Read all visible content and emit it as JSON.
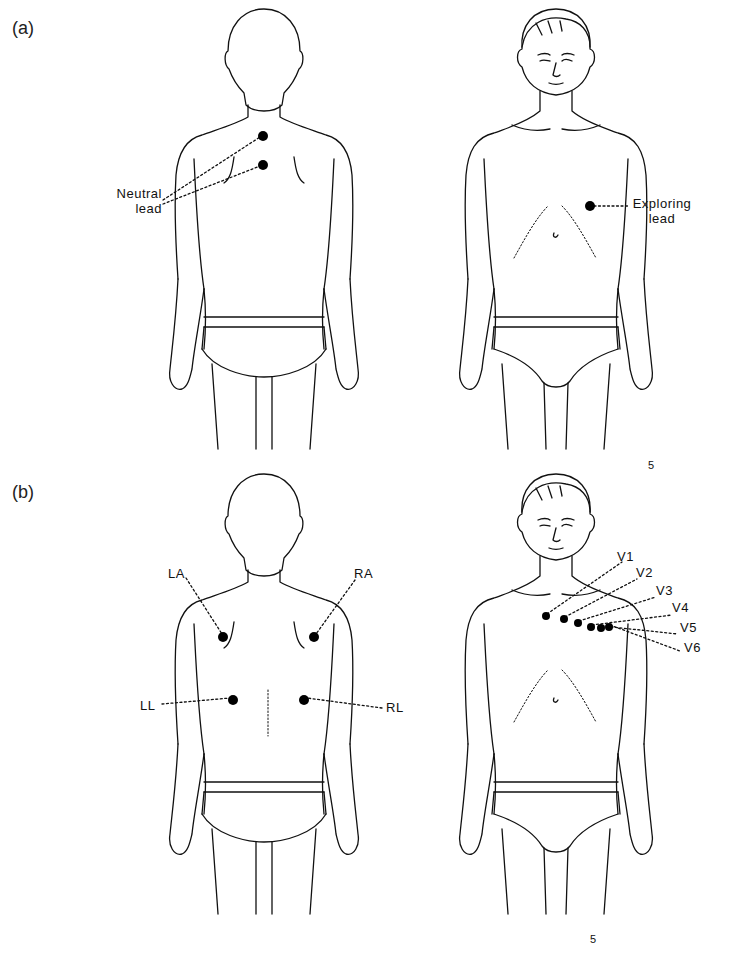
{
  "figure": {
    "panels": [
      {
        "id": "a",
        "label": "(a)",
        "figures": [
          {
            "view": "back",
            "electrodes": [
              {
                "x": 263,
                "y": 136
              },
              {
                "x": 263,
                "y": 165
              }
            ]
          },
          {
            "view": "front",
            "electrodes": [
              {
                "x": 590,
                "y": 206
              }
            ]
          }
        ],
        "annotations": {
          "neutral_lead": {
            "line1": "Neutral",
            "line2": "lead"
          },
          "exploring_lead": {
            "line1": "Exploring",
            "line2": "lead"
          }
        }
      },
      {
        "id": "b",
        "label": "(b)",
        "figures": [
          {
            "view": "back",
            "electrodes": [
              {
                "name": "LA",
                "x": 223,
                "y": 637
              },
              {
                "name": "RA",
                "x": 314,
                "y": 637
              },
              {
                "name": "LL",
                "x": 233,
                "y": 700
              },
              {
                "name": "RL",
                "x": 304,
                "y": 700
              }
            ]
          },
          {
            "view": "front",
            "electrodes": [
              {
                "name": "V1",
                "x": 546,
                "y": 616
              },
              {
                "name": "V2",
                "x": 564,
                "y": 619
              },
              {
                "name": "V3",
                "x": 578,
                "y": 623
              },
              {
                "name": "V4",
                "x": 591,
                "y": 627
              },
              {
                "name": "V5",
                "x": 601,
                "y": 628
              },
              {
                "name": "V6",
                "x": 609,
                "y": 627
              }
            ]
          }
        ],
        "limb_labels": {
          "LA": "LA",
          "RA": "RA",
          "LL": "LL",
          "RL": "RL"
        },
        "chest_labels": [
          "V1",
          "V2",
          "V3",
          "V4",
          "V5",
          "V6"
        ]
      }
    ],
    "artist_mark": "5"
  }
}
